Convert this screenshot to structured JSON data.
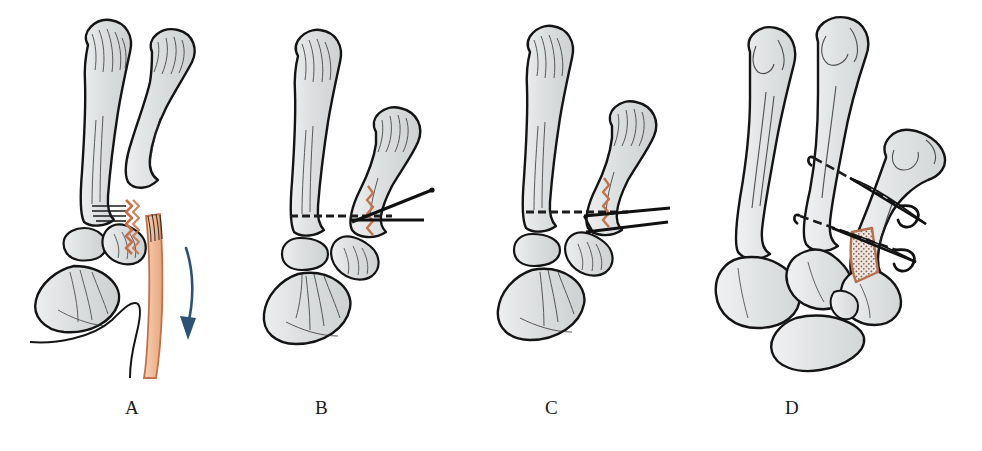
{
  "figure": {
    "background_color": "#ffffff",
    "width": 982,
    "height": 451,
    "kind": "medical-surgical-technique-illustration",
    "panel_count": 4
  },
  "palette": {
    "bone_fill": "#d9dcdd",
    "bone_fill_light": "#e8eaeb",
    "bone_outline": "#141414",
    "bone_hatch": "#2a2a2a",
    "fracture_line": "#c4714a",
    "graft_tendon_fill": "#f0bb99",
    "graft_tendon_outline": "#c4714a",
    "arrow_color": "#2e5273",
    "wire_color": "#111111",
    "dashed_line": "#1c1c1c",
    "graft_stipple": "#b4704f",
    "label_color": "#1a1a1a"
  },
  "panels": [
    {
      "id": "panel-a",
      "label": "A",
      "label_x": 125,
      "label_y": 398,
      "caption_meaning": "Displaced fracture of the thumb metacarpal base with volar fragment and tendon graft strip; arrow shows direction of displacement",
      "features": {
        "fracture_line": "jagged orange fracture at metacarpal base",
        "arrow": "curved downward arrow",
        "arrow_color": "#2e5273",
        "tendon_strip": "peach tendon/graft strip running distally",
        "wires": 0,
        "dashed_reduction_line": false,
        "bone_graft": false
      }
    },
    {
      "id": "panel-b",
      "label": "B",
      "label_x": 315,
      "label_y": 398,
      "caption_meaning": "Fracture reduced, joint line marked, two converging K-wires inserted from the radial side",
      "features": {
        "fracture_line": "reduced jagged orange line",
        "arrow": null,
        "arrow_color": null,
        "tendon_strip": null,
        "wires": 2,
        "wire_layout": "one horizontal, one oblique converging at the metacarpal base",
        "dashed_reduction_line": true,
        "bone_graft": false
      }
    },
    {
      "id": "panel-c",
      "label": "C",
      "label_x": 545,
      "label_y": 398,
      "caption_meaning": "Two near-parallel K-wires seated across the reduced fracture",
      "features": {
        "fracture_line": "jagged orange line across base",
        "arrow": null,
        "arrow_color": null,
        "tendon_strip": null,
        "wires": 2,
        "wire_layout": "two nearly parallel wires entering from the radial side",
        "dashed_reduction_line": true,
        "bone_graft": false
      }
    },
    {
      "id": "panel-d",
      "label": "D",
      "label_x": 785,
      "label_y": 398,
      "caption_meaning": "Dorsal oblique view: K-wires with bent exposed ends and cancellous bone graft packed into the defect",
      "features": {
        "fracture_line": null,
        "arrow": null,
        "arrow_color": null,
        "tendon_strip": null,
        "wires": 2,
        "wire_layout": "two wires crossing the metacarpals with bent hooked ends protruding on the ulnar side",
        "dashed_reduction_line": true,
        "bone_graft": true,
        "bone_graft_style": "stippled triangular graft with orange-brown border"
      }
    }
  ]
}
